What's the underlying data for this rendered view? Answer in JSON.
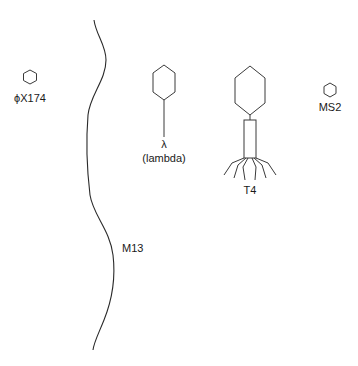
{
  "diagram": {
    "phages": [
      {
        "id": "phiX174",
        "label": "ϕX174",
        "shape": "small icosahedral head"
      },
      {
        "id": "M13",
        "label": "M13",
        "shape": "long filament"
      },
      {
        "id": "lambda",
        "label": "λ",
        "sublabel": "(lambda)",
        "shape": "head with flexible tail"
      },
      {
        "id": "T4",
        "label": "T4",
        "shape": "elongated head with contractile tail and tail fibers"
      },
      {
        "id": "MS2",
        "label": "MS2",
        "shape": "small icosahedral head"
      }
    ]
  },
  "colors": {
    "stroke": "#3a3a3a",
    "text": "#1a1a1a",
    "background": "#ffffff"
  }
}
